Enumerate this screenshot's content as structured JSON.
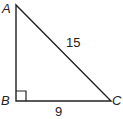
{
  "diagram": {
    "type": "right-triangle",
    "vertices": {
      "A": {
        "label": "A"
      },
      "B": {
        "label": "B"
      },
      "C": {
        "label": "C"
      }
    },
    "right_angle_at": "B",
    "sides": {
      "AC": {
        "label": "15"
      },
      "BC": {
        "label": "9"
      }
    },
    "colors": {
      "stroke": "#222222",
      "background": "#ffffff"
    }
  }
}
